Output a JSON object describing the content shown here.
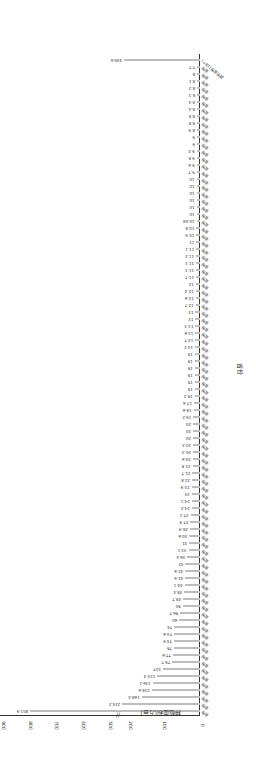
{
  "chart_data": {
    "type": "bar",
    "orientation": "horizontal",
    "rendered_rotation_deg": 180,
    "title": "",
    "xlabel": "种植面积(万亩)",
    "ylabel": "省份",
    "axis_break": [
      225,
      480
    ],
    "ticks": [
      "0",
      "100",
      "200",
      "500",
      "600",
      "700",
      "800",
      "900"
    ],
    "categories_count": 93,
    "last_category": "其他省份(18个)",
    "values": [
      801.9,
      224.2,
      168.4,
      138.6,
      136.1,
      123.4,
      107,
      79.7,
      77.6,
      75,
      74.9,
      74.6,
      74,
      60,
      56.7,
      50,
      48.7,
      45.4,
      44.1,
      42.6,
      42.6,
      42,
      36.4,
      33.1,
      31,
      30.6,
      28.9,
      27.5,
      27.1,
      24.2,
      24.1,
      24,
      23.9,
      22.8,
      21.7,
      21.5,
      20.6,
      20.3,
      20.2,
      20,
      20,
      20,
      19.2,
      18.6,
      17.6,
      15.2,
      15,
      15,
      15,
      15,
      15,
      15,
      14.2,
      13.7,
      13.6,
      13.3,
      13,
      13,
      12.7,
      12.6,
      12.4,
      12,
      11.7,
      11.3,
      11.3,
      11.3,
      11.1,
      11,
      10.9,
      10.5,
      10.08,
      10,
      10,
      10,
      10,
      10,
      10,
      9.7,
      9.6,
      9.5,
      9.3,
      9,
      9,
      8.9,
      8.5,
      8.5,
      8.4,
      8.4,
      8.3,
      8.2,
      8.1,
      8,
      7.7,
      449.6
    ],
    "bar_color": "#bdbdbd"
  }
}
